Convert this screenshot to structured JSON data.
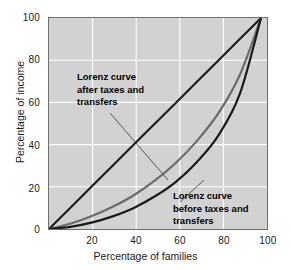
{
  "chart_data": {
    "type": "line",
    "title": "",
    "xlabel": "Percentage of families",
    "ylabel": "Percentage of income",
    "xlim": [
      0,
      100
    ],
    "ylim": [
      0,
      100
    ],
    "xticks": [
      "20",
      "40",
      "60",
      "80",
      "100"
    ],
    "yticks": [
      "0",
      "20",
      "40",
      "60",
      "80",
      "100"
    ],
    "grid": true,
    "legend_position": "inline-annotations",
    "series": [
      {
        "name": "Line of equality",
        "color": "#1a1a1a",
        "x": [
          0,
          10,
          20,
          30,
          40,
          50,
          60,
          70,
          80,
          90,
          100
        ],
        "values": [
          0,
          10,
          20,
          30,
          40,
          50,
          60,
          70,
          80,
          90,
          100
        ]
      },
      {
        "name": "Lorenz curve after taxes and transfers",
        "color": "#6b6b6b",
        "x": [
          0,
          10,
          20,
          30,
          40,
          50,
          60,
          70,
          80,
          90,
          100
        ],
        "values": [
          0,
          2.5,
          6,
          10.5,
          16,
          23,
          31.5,
          42,
          55,
          73,
          100
        ]
      },
      {
        "name": "Lorenz curve before taxes and transfers",
        "color": "#1a1a1a",
        "x": [
          0,
          10,
          20,
          30,
          40,
          50,
          60,
          70,
          80,
          90,
          100
        ],
        "values": [
          0,
          1,
          3,
          6,
          10,
          15.5,
          22.5,
          32,
          44.5,
          64,
          100
        ]
      }
    ],
    "annotations": [
      {
        "id": "after",
        "lines": [
          "Lorenz curve",
          "after taxes and",
          "transfers"
        ],
        "points_to": "Lorenz curve after taxes and transfers"
      },
      {
        "id": "before",
        "lines": [
          "Lorenz curve",
          "before taxes and",
          "transfers"
        ],
        "points_to": "Lorenz curve before taxes and transfers"
      }
    ]
  }
}
